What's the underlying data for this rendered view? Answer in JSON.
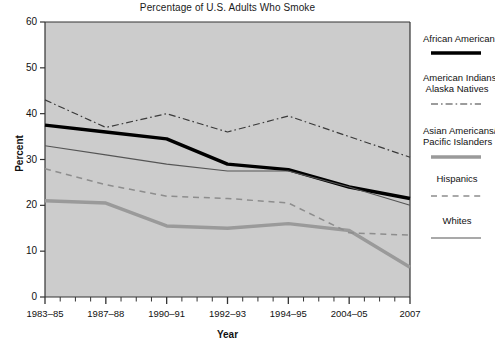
{
  "chart_data": {
    "type": "line",
    "title": "Percentage of U.S. Adults Who Smoke",
    "xlabel": "Year",
    "ylabel": "Percent",
    "categories": [
      "1983–85",
      "1987–88",
      "1990–91",
      "1992–93",
      "1994–95",
      "2004–05",
      "2007"
    ],
    "ylim": [
      0,
      60
    ],
    "yticks": [
      0,
      10,
      20,
      30,
      40,
      50,
      60
    ],
    "grid": false,
    "legend_position": "right",
    "plot_background": "#cccccc",
    "series": [
      {
        "name": "African American",
        "style": "solid",
        "color": "#000000",
        "width": 3.4,
        "values": [
          37.5,
          36.0,
          34.5,
          29.0,
          27.8,
          24.0,
          21.5
        ]
      },
      {
        "name": "American Indians/\nAlaska Natives",
        "label_line1": "American Indians/",
        "label_line2": "Alaska Natives",
        "style": "dash-dot",
        "color": "#3a3a3a",
        "width": 1.2,
        "values": [
          43.0,
          37.0,
          40.0,
          36.0,
          39.5,
          35.0,
          30.5
        ]
      },
      {
        "name": "Asian Americans/\nPacific Islanders",
        "label_line1": "Asian Americans/",
        "label_line2": "Pacific Islanders",
        "style": "solid",
        "color": "#9a9a9a",
        "width": 3.4,
        "values": [
          21.0,
          20.5,
          15.5,
          15.0,
          16.0,
          14.5,
          6.5
        ]
      },
      {
        "name": "Hispanics",
        "style": "dashed",
        "color": "#8d8d8d",
        "width": 1.5,
        "values": [
          28.0,
          24.5,
          22.0,
          21.5,
          20.5,
          14.0,
          13.5
        ]
      },
      {
        "name": "Whites",
        "style": "solid",
        "color": "#555555",
        "width": 1.1,
        "values": [
          33.0,
          31.0,
          29.0,
          27.5,
          27.5,
          24.0,
          20.0
        ]
      }
    ]
  },
  "legend": {
    "entries": [
      {
        "label": "African American",
        "label2": ""
      },
      {
        "label": "American Indians/",
        "label2": "Alaska Natives"
      },
      {
        "label": "Asian Americans/",
        "label2": "Pacific Islanders"
      },
      {
        "label": "Hispanics",
        "label2": ""
      },
      {
        "label": "Whites",
        "label2": ""
      }
    ]
  }
}
